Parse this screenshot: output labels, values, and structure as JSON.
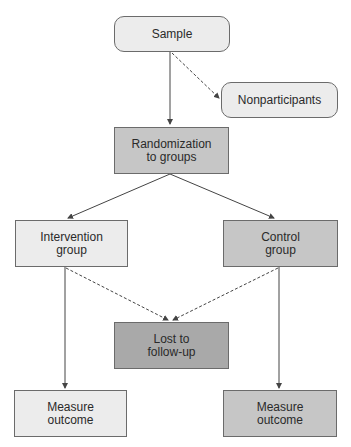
{
  "diagram": {
    "type": "flowchart",
    "title": "",
    "colors": {
      "light_fill": "#ececec",
      "mid_fill": "#c6c6c6",
      "dark_fill": "#a9a9a9",
      "border": "#6b6b6b",
      "line": "#444444"
    },
    "nodes": {
      "sample": {
        "line1": "Sample",
        "line2": ""
      },
      "nonparticipants": {
        "line1": "Nonparticipants",
        "line2": ""
      },
      "randomization": {
        "line1": "Randomization",
        "line2": "to groups"
      },
      "intervention": {
        "line1": "Intervention",
        "line2": "group"
      },
      "control": {
        "line1": "Control",
        "line2": "group"
      },
      "lost": {
        "line1": "Lost to",
        "line2": "follow-up"
      },
      "measure_intervention": {
        "line1": "Measure",
        "line2": "outcome"
      },
      "measure_control": {
        "line1": "Measure",
        "line2": "outcome"
      }
    },
    "edges": [
      {
        "from": "sample",
        "to": "randomization",
        "style": "solid"
      },
      {
        "from": "sample",
        "to": "nonparticipants",
        "style": "dashed"
      },
      {
        "from": "randomization",
        "to": "intervention",
        "style": "solid"
      },
      {
        "from": "randomization",
        "to": "control",
        "style": "solid"
      },
      {
        "from": "intervention",
        "to": "lost",
        "style": "dashed"
      },
      {
        "from": "control",
        "to": "lost",
        "style": "dashed"
      },
      {
        "from": "intervention",
        "to": "measure_intervention",
        "style": "solid"
      },
      {
        "from": "control",
        "to": "measure_control",
        "style": "solid"
      }
    ]
  }
}
